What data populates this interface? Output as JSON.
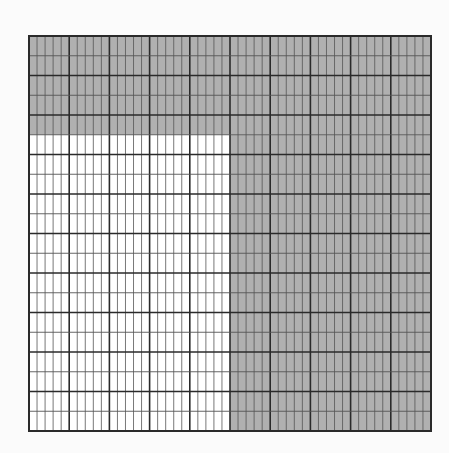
{
  "figure": {
    "type": "area-model-grid",
    "columns": 50,
    "rows": 20,
    "major_col_every": 5,
    "major_row_every": 2,
    "cell_width": 8.04,
    "cell_height": 19.75,
    "colors": {
      "shaded": "#b0b0b0",
      "unshaded": "#ffffff",
      "minor_line": "#555555",
      "major_line": "#2a2a2a",
      "background": "#fbfbfb"
    },
    "shaded_regions": [
      {
        "name": "top-band",
        "col_start": 0,
        "col_end": 50,
        "row_start": 0,
        "row_end": 5
      },
      {
        "name": "right-block",
        "col_start": 25,
        "col_end": 50,
        "row_start": 5,
        "row_end": 20
      }
    ],
    "unshaded_region": {
      "col_start": 0,
      "col_end": 25,
      "row_start": 5,
      "row_end": 20
    },
    "counts": {
      "total_cells": 1000,
      "shaded_cells": 625,
      "unshaded_cells": 375
    }
  }
}
